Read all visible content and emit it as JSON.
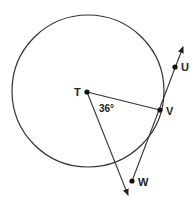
{
  "diagram": {
    "circle": {
      "cx": 88,
      "cy": 91,
      "r": 76,
      "stroke": "#333333"
    },
    "points": [
      {
        "name": "T",
        "x": 87,
        "y": 92,
        "label_dx": -13,
        "label_dy": 4
      },
      {
        "name": "V",
        "x": 160,
        "y": 110,
        "label_dx": 6,
        "label_dy": 5
      },
      {
        "name": "U",
        "x": 175,
        "y": 67,
        "label_dx": 6,
        "label_dy": 4
      },
      {
        "name": "W",
        "x": 132,
        "y": 181,
        "label_dx": 6,
        "label_dy": 5
      }
    ],
    "angle_label": {
      "text": "36°",
      "x": 100,
      "y": 112
    },
    "labels": {
      "T": "T",
      "V": "V",
      "U": "U",
      "W": "W"
    }
  }
}
